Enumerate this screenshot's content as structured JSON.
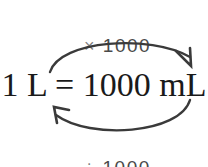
{
  "diagram": {
    "title_text": "1 L = 1000 mL",
    "background_color": "#ffffff",
    "top_label": {
      "sign": "×",
      "value": "1000",
      "full_text": "× 1000",
      "color": "#606060",
      "direction": "left-to-right"
    },
    "bottom_label": {
      "sign": "÷",
      "value": "1000",
      "full_text": "÷ 1000",
      "color": "#606060",
      "direction": "right-to-left"
    },
    "equation": {
      "left_value": "1",
      "left_unit": "L",
      "relation": "=",
      "right_value": "1000",
      "right_unit": "mL",
      "full_text": "1 L = 1000 mL",
      "color": "#1a1a1a"
    },
    "arrows": {
      "stroke_color": "#3a3a3a",
      "stroke_width": "2.4",
      "top_arrow_name": "multiply-arrow",
      "bottom_arrow_name": "divide-arrow"
    }
  }
}
